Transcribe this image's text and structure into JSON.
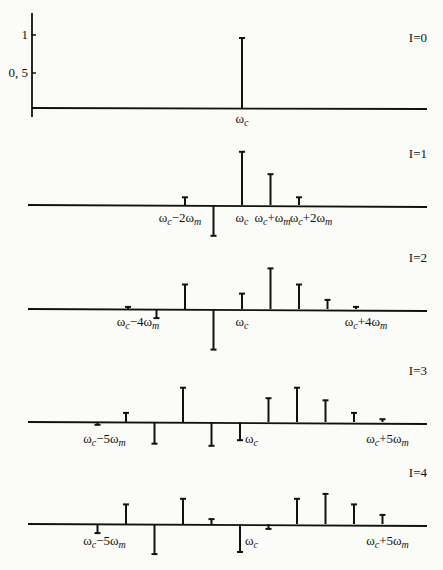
{
  "chart_data": {
    "type": "bar",
    "subtype": "stem-spectrum",
    "title": "",
    "xlabel": "",
    "ylabel": "",
    "ylim": [
      -0.6,
      1.0
    ],
    "y_ticks": [
      {
        "value": 1,
        "label": "1"
      },
      {
        "value": 0.5,
        "label": "0, 5"
      }
    ],
    "x_unit": "omega_m offsets from omega_c",
    "panels": [
      {
        "label": "I=0",
        "offsets": [
          0
        ],
        "values": [
          1.0
        ],
        "annotations": [
          {
            "offset": 0,
            "text": "ωc",
            "main": "ω",
            "sub": "c"
          }
        ]
      },
      {
        "label": "I=1",
        "offsets": [
          -2,
          -1,
          0,
          1,
          2
        ],
        "values": [
          0.11,
          -0.44,
          0.76,
          0.44,
          0.11
        ],
        "annotations": [
          {
            "offset": -2,
            "text": "ωc−2ωm"
          },
          {
            "offset": 0,
            "text": "ωc"
          },
          {
            "offset": 1,
            "text": "ωc+ωm"
          },
          {
            "offset": 2,
            "text": "ωc+2ωm"
          }
        ]
      },
      {
        "label": "I=2",
        "offsets": [
          -4,
          -3,
          -2,
          -1,
          0,
          1,
          2,
          3,
          4
        ],
        "values": [
          0.03,
          -0.13,
          0.35,
          -0.58,
          0.22,
          0.58,
          0.35,
          0.13,
          0.03
        ],
        "annotations": [
          {
            "offset": -4,
            "text": "ωc−4ωm"
          },
          {
            "offset": 0,
            "text": "ωc"
          },
          {
            "offset": 4,
            "text": "ωc+4ωm"
          }
        ]
      },
      {
        "label": "I=3",
        "offsets": [
          -5,
          -4,
          -3,
          -2,
          -1,
          0,
          1,
          2,
          3,
          4,
          5
        ],
        "values": [
          -0.04,
          0.13,
          -0.31,
          0.49,
          -0.34,
          -0.26,
          0.34,
          0.49,
          0.31,
          0.13,
          0.04
        ],
        "annotations": [
          {
            "offset": -5,
            "text": "ωc−5ωm"
          },
          {
            "offset": 0,
            "text": "ωc"
          },
          {
            "offset": 5,
            "text": "ωc+5ωm"
          }
        ]
      },
      {
        "label": "I=4",
        "offsets": [
          -5,
          -4,
          -3,
          -2,
          -1,
          0,
          1,
          2,
          3,
          4,
          5
        ],
        "values": [
          -0.13,
          0.28,
          -0.43,
          0.36,
          0.07,
          -0.4,
          -0.07,
          0.36,
          0.43,
          0.28,
          0.13
        ],
        "annotations": [
          {
            "offset": -5,
            "text": "ωc−5ωm"
          },
          {
            "offset": 0,
            "text": "ωc"
          },
          {
            "offset": 5,
            "text": "ωc+5ωm"
          }
        ]
      }
    ]
  },
  "layout": {
    "center_x": 242,
    "spacing": 28.5,
    "unit_px": 70,
    "baselines": [
      108,
      205,
      309,
      422,
      524
    ],
    "axis_left": 32,
    "axis_right": 427,
    "line_color": "#111111"
  },
  "labels": {
    "panel_titles": [
      "I=0",
      "I=1",
      "I=2",
      "I=3",
      "I=4"
    ],
    "y_tick_1": "1",
    "y_tick_half": "0, 5"
  }
}
